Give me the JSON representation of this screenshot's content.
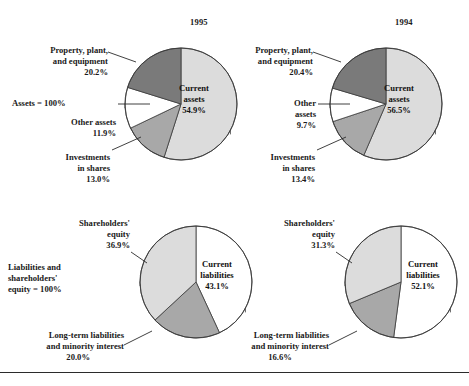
{
  "figure": {
    "title_left": "1995",
    "title_right": "1994",
    "assets_note": "Assets = 100%",
    "liabilities_note_lines": [
      "Liabilities and",
      "shareholders'",
      "equity = 100%"
    ],
    "rule_color": "#2b2b2b"
  },
  "colors": {
    "light_gray": "#dcdcdc",
    "mid_gray": "#a8a8a8",
    "dark_gray": "#7a7a7a",
    "white": "#ffffff",
    "shadow": "#4d4d4d",
    "outline": "#3a3a3a",
    "text": "#1a1a1a"
  },
  "labels": {
    "ppe_line1": "Property, plant,",
    "ppe_line2": "and equipment",
    "other_assets_one_line": "Other assets",
    "other_line1": "Other",
    "other_line2": "assets",
    "investments_line1": "Investments",
    "investments_line2": "in shares",
    "current_assets_line1": "Current",
    "current_assets_line2": "assets",
    "shareholders_line1": "Shareholders'",
    "shareholders_line2": "equity",
    "longterm_line1": "Long-term liabilities",
    "longterm_line2": "and minority interest",
    "current_liabilities_line1": "Current",
    "current_liabilities_line2": "liabilities"
  },
  "chart_data": [
    {
      "id": "assets-1995",
      "type": "pie",
      "title": "1995",
      "group": "Assets",
      "total_label": "Assets = 100%",
      "categories": [
        "Current assets",
        "Investments in shares",
        "Other assets",
        "Property, plant, and equipment"
      ],
      "values": [
        54.9,
        13.0,
        11.9,
        20.2
      ],
      "value_labels": [
        "54.9%",
        "13.0%",
        "11.9%",
        "20.2%"
      ],
      "slice_colors": [
        "#dcdcdc",
        "#a8a8a8",
        "#ffffff",
        "#7a7a7a"
      ],
      "start_angle_deg": 0,
      "direction": "clockwise"
    },
    {
      "id": "assets-1994",
      "type": "pie",
      "title": "1994",
      "group": "Assets",
      "total_label": "Assets = 100%",
      "categories": [
        "Current assets",
        "Investments in shares",
        "Other assets",
        "Property, plant, and equipment"
      ],
      "values": [
        56.5,
        13.4,
        9.7,
        20.4
      ],
      "value_labels": [
        "56.5%",
        "13.4%",
        "9.7%",
        "20.4%"
      ],
      "slice_colors": [
        "#dcdcdc",
        "#a8a8a8",
        "#ffffff",
        "#7a7a7a"
      ],
      "start_angle_deg": 0,
      "direction": "clockwise"
    },
    {
      "id": "liabilities-1995",
      "type": "pie",
      "title": "1995",
      "group": "Liabilities and shareholders' equity",
      "total_label": "Liabilities and shareholders' equity = 100%",
      "categories": [
        "Current liabilities",
        "Long-term liabilities and minority interest",
        "Shareholders' equity"
      ],
      "values": [
        43.1,
        20.0,
        36.9
      ],
      "value_labels": [
        "43.1%",
        "20.0%",
        "36.9%"
      ],
      "slice_colors": [
        "#ffffff",
        "#a8a8a8",
        "#dcdcdc"
      ],
      "start_angle_deg": 0,
      "direction": "clockwise"
    },
    {
      "id": "liabilities-1994",
      "type": "pie",
      "title": "1994",
      "group": "Liabilities and shareholders' equity",
      "total_label": "Liabilities and shareholders' equity = 100%",
      "categories": [
        "Current liabilities",
        "Long-term liabilities and minority interest",
        "Shareholders' equity"
      ],
      "values": [
        52.1,
        16.6,
        31.3
      ],
      "value_labels": [
        "52.1%",
        "16.6%",
        "31.3%"
      ],
      "slice_colors": [
        "#ffffff",
        "#a8a8a8",
        "#dcdcdc"
      ],
      "start_angle_deg": 0,
      "direction": "clockwise"
    }
  ],
  "values": {
    "a95": {
      "ca": "54.9%",
      "inv": "13.0%",
      "oa": "11.9%",
      "ppe": "20.2%"
    },
    "a94": {
      "ca": "56.5%",
      "inv": "13.4%",
      "oa": "9.7%",
      "ppe": "20.4%"
    },
    "l95": {
      "cl": "43.1%",
      "lt": "20.0%",
      "se": "36.9%"
    },
    "l94": {
      "cl": "52.1%",
      "lt": "16.6%",
      "se": "31.3%"
    }
  }
}
